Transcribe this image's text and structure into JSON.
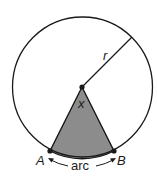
{
  "diagram": {
    "labels": {
      "radius": "r",
      "angle": "x",
      "point_a": "A",
      "point_b": "B",
      "arc": "arc"
    },
    "colors": {
      "stroke": "#1a1a1a",
      "sector_fill": "#8c8c8c",
      "background": "#ffffff"
    }
  }
}
